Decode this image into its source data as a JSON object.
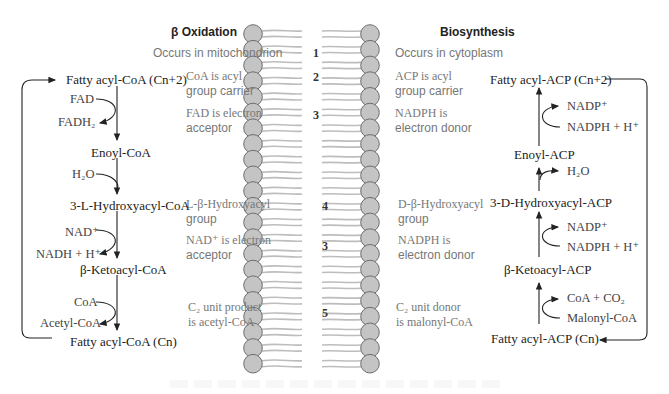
{
  "diagram": {
    "left_title": "β Oxidation",
    "right_title": "Biosynthesis",
    "comparisons": [
      {
        "number": "1",
        "left": [
          "Occurs in mitochondrion"
        ],
        "right": [
          "Occurs in cytoplasm"
        ]
      },
      {
        "number": "2",
        "left": [
          "CoA is acyl",
          "group carrier"
        ],
        "right": [
          "ACP is acyl",
          "group carrier"
        ]
      },
      {
        "number": "3",
        "left": [
          "FAD is electron",
          "acceptor"
        ],
        "right": [
          "NADPH is",
          "electron donor"
        ]
      },
      {
        "number": "4",
        "left": [
          "L-β-Hydroxyacyl",
          "group"
        ],
        "right": [
          "D-β-Hydroxyacyl",
          "group"
        ]
      },
      {
        "number": "3",
        "left": [
          "NAD⁺ is electron",
          "acceptor"
        ],
        "right": [
          "NADPH is",
          "electron donor"
        ]
      },
      {
        "number": "5",
        "left": [
          "C₂ unit product",
          "is acetyl-CoA"
        ],
        "right": [
          "C₂ unit donor",
          "is malonyl-CoA"
        ]
      }
    ],
    "beta_oxidation": {
      "intermediates": [
        "Fatty acyl-CoA (Cn+2)",
        "Enoyl-CoA",
        "3-L-Hydroxyacyl-CoA",
        "β-Ketoacyl-CoA",
        "Fatty acyl-CoA (Cn)"
      ],
      "cofactors": [
        {
          "in": "FAD",
          "out": "FADH₂"
        },
        {
          "in": "H₂O",
          "out": ""
        },
        {
          "in": "NAD⁺",
          "out": "NADH + H⁺"
        },
        {
          "in": "CoA",
          "out": "Acetyl-CoA"
        }
      ]
    },
    "biosynthesis": {
      "intermediates": [
        "Fatty acyl-ACP (Cn+2)",
        "Enoyl-ACP",
        "3-D-Hydroxyacyl-ACP",
        "β-Ketoacyl-ACP",
        "Fatty acyl-ACP (Cn)"
      ],
      "cofactors": [
        {
          "in": "NADPH + H⁺",
          "out": "NADP⁺"
        },
        {
          "in": "",
          "out": "H₂O"
        },
        {
          "in": "NADPH + H⁺",
          "out": "NADP⁺"
        },
        {
          "in": "Malonyl-CoA",
          "out": "CoA + CO₂"
        }
      ]
    },
    "colors": {
      "bead_fill": "#c4c4c4",
      "bead_stroke": "#6e6e6e",
      "tail": "#bdbdbd",
      "arrow": "#222222",
      "comparison_text": "#777777"
    }
  }
}
